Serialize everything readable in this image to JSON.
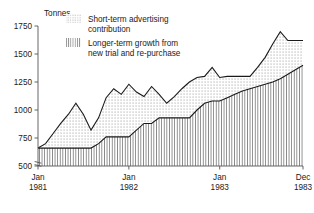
{
  "chart_data": {
    "type": "area",
    "title": "",
    "subtitle": "",
    "xlabel": "",
    "ylabel": "Tonnes",
    "ylim": [
      500,
      1750
    ],
    "yticks": [
      500,
      750,
      1000,
      1250,
      1500,
      1750
    ],
    "ytick_labels": [
      "500",
      "750",
      "1000",
      "1250",
      "1500",
      "1750"
    ],
    "y_axis_break": true,
    "grid": false,
    "legend_position": "top-center",
    "x": [
      "Jan 1981",
      "Feb 1981",
      "Mar 1981",
      "Apr 1981",
      "May 1981",
      "Jun 1981",
      "Jul 1981",
      "Aug 1981",
      "Sep 1981",
      "Oct 1981",
      "Nov 1981",
      "Dec 1981",
      "Jan 1982",
      "Feb 1982",
      "Mar 1982",
      "Apr 1982",
      "May 1982",
      "Jun 1982",
      "Jul 1982",
      "Aug 1982",
      "Sep 1982",
      "Oct 1982",
      "Nov 1982",
      "Dec 1982",
      "Jan 1983",
      "Feb 1983",
      "Mar 1983",
      "Apr 1983",
      "May 1983",
      "Jun 1983",
      "Jul 1983",
      "Aug 1983",
      "Sep 1983",
      "Oct 1983",
      "Nov 1983",
      "Dec 1983"
    ],
    "xticks": [
      "Jan",
      "Jan",
      "Jan",
      "Dec"
    ],
    "xtick_years": [
      "1981",
      "1982",
      "1983",
      "1983"
    ],
    "xtick_index": [
      0,
      12,
      24,
      35
    ],
    "series": [
      {
        "name": "Longer-term growth from new trial and re-purchase",
        "pattern": "vertical-hatch",
        "stack_order": 1,
        "values": [
          660,
          660,
          660,
          660,
          660,
          660,
          660,
          660,
          700,
          760,
          760,
          760,
          760,
          820,
          880,
          880,
          930,
          930,
          930,
          930,
          930,
          1000,
          1060,
          1080,
          1080,
          1110,
          1140,
          1170,
          1190,
          1210,
          1230,
          1250,
          1280,
          1320,
          1360,
          1400
        ]
      },
      {
        "name": "Short-term advertising contribution",
        "pattern": "stipple-dots",
        "stack_order": 2,
        "values": [
          660,
          700,
          790,
          880,
          960,
          1060,
          960,
          820,
          930,
          1110,
          1190,
          1140,
          1230,
          1160,
          1120,
          1210,
          1140,
          1060,
          1120,
          1190,
          1250,
          1290,
          1300,
          1380,
          1290,
          1300,
          1300,
          1300,
          1300,
          1380,
          1470,
          1590,
          1700,
          1620,
          1620,
          1620
        ]
      }
    ],
    "legend": [
      {
        "label_line1": "Short-term advertising",
        "label_line2": "contribution",
        "pattern": "stipple-dots"
      },
      {
        "label_line1": "Longer-term growth from",
        "label_line2": "new trial and re-purchase",
        "pattern": "vertical-hatch"
      }
    ],
    "colors": {
      "line": "#1a1a1a",
      "axis": "#555555",
      "text": "#1a1a1a",
      "stipple": "#8a8a8a",
      "hatch": "#8a8a8a",
      "background": "#ffffff"
    }
  }
}
